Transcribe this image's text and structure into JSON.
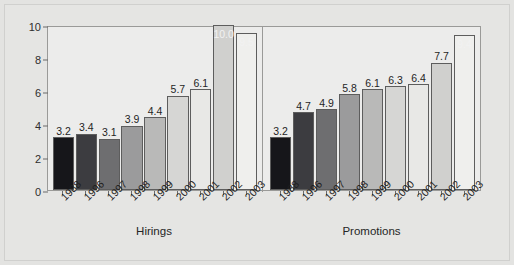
{
  "chart_data": {
    "type": "bar",
    "title": "",
    "xlabel": "",
    "ylabel": "",
    "ylim": [
      0,
      10
    ],
    "yticks": [
      0,
      2,
      4,
      6,
      8,
      10
    ],
    "grid": false,
    "legend": "none",
    "categories": [
      "1988",
      "1996",
      "1997",
      "1998",
      "1999",
      "2000",
      "2001",
      "2002",
      "2003"
    ],
    "groups": [
      {
        "name": "Hirings",
        "values": [
          3.2,
          3.4,
          3.1,
          3.9,
          4.4,
          5.7,
          6.1,
          10.0,
          9.5
        ],
        "labels": [
          "3.2",
          "3.4",
          "3.1",
          "3.9",
          "4.4",
          "5.7",
          "6.1",
          "10.0",
          "9.5"
        ],
        "label_placement": [
          "outside",
          "outside",
          "outside",
          "outside",
          "outside",
          "outside",
          "outside",
          "inside",
          "inside"
        ]
      },
      {
        "name": "Promotions",
        "values": [
          3.2,
          4.7,
          4.9,
          5.8,
          6.1,
          6.3,
          6.4,
          7.7,
          9.4
        ],
        "labels": [
          "3.2",
          "4.7",
          "4.9",
          "5.8",
          "6.1",
          "6.3",
          "6.4",
          "7.7",
          "9.4"
        ],
        "label_placement": [
          "outside",
          "outside",
          "outside",
          "outside",
          "outside",
          "outside",
          "outside",
          "outside",
          "inside"
        ]
      }
    ],
    "bar_colors": [
      "#16161a",
      "#3c3c40",
      "#6e6e70",
      "#9b9b9c",
      "#b9b9b8",
      "#d6d6d4",
      "#e8e8e6",
      "#d0d0ce",
      "#efefed"
    ],
    "series_palette_note": "grayscale per-year shading"
  },
  "colors": {
    "page_background": "#e3e3e1",
    "plot_background": "#ececeb",
    "axis_line": "#9a9a98",
    "text": "#1f1f1f",
    "inside_label": "#f2f2f2"
  }
}
